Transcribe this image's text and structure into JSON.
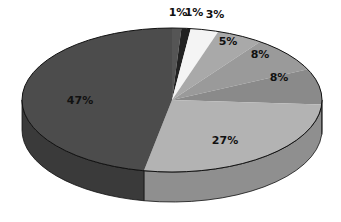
{
  "chart_data": {
    "type": "pie",
    "style": "3d",
    "title": "",
    "categories": [
      "Slice 1",
      "Slice 2",
      "Slice 3",
      "Slice 4",
      "Slice 5",
      "Slice 6",
      "Slice 7",
      "Slice 8"
    ],
    "values": [
      1,
      1,
      3,
      5,
      8,
      8,
      27,
      47
    ],
    "labels": [
      "1%",
      "1%",
      "3%",
      "5%",
      "8%",
      "8%",
      "27%",
      "47%"
    ],
    "colors": [
      "#555555",
      "#222222",
      "#f4f4f4",
      "#a9a9a9",
      "#9a9a9a",
      "#8a8a8a",
      "#b3b3b3",
      "#4c4c4c"
    ],
    "side_colors": [
      "#3f3f3f",
      "#181818",
      "#cfcfcf",
      "#8a8a8a",
      "#7d7d7d",
      "#6f6f6f",
      "#8f8f8f",
      "#3a3a3a"
    ],
    "start_angle_deg": 90,
    "direction": "clockwise",
    "legend": null
  }
}
